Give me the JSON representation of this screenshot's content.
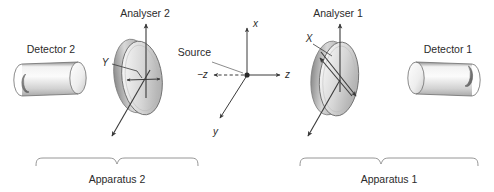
{
  "figure": {
    "title_text": "",
    "background_color": "#ffffff",
    "line_color": "#3a3a3a",
    "label_color": "#2b2b2b",
    "brace_color": "#8a8a8a",
    "width": 494,
    "height": 192
  },
  "labels": {
    "detector_2": "Detector 2",
    "detector_1": "Detector 1",
    "analyser_2": "Analyser 2",
    "analyser_1": "Analyser 1",
    "source": "Source",
    "apparatus_2": "Apparatus 2",
    "apparatus_1": "Apparatus 1",
    "disc_2_axis": "Y",
    "disc_1_axis": "X"
  },
  "axes": {
    "x_label": "x",
    "y_label": "y",
    "z_positive_label": "z",
    "z_negative_label": "−z",
    "origin_marker": "source-point"
  },
  "icons": {
    "detector_2": "cylinder-icon",
    "detector_1": "cylinder-icon",
    "analyser_2": "polarizer-disc-icon",
    "analyser_1": "polarizer-disc-icon",
    "source_point": "source-dot-icon",
    "x_axis_arrow": "arrow-up-icon",
    "y_axis_arrow": "arrow-down-left-icon",
    "z_positive_arrow": "arrow-right-icon",
    "z_negative_arrow": "arrow-left-icon",
    "brace_2": "brace-icon",
    "brace_1": "brace-icon"
  }
}
